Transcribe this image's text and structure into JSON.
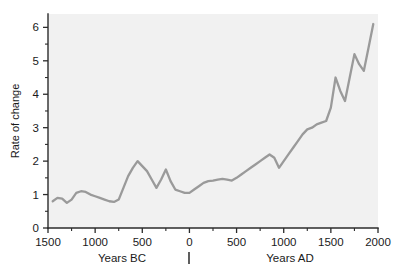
{
  "chart_data": {
    "type": "line",
    "title": "",
    "subtitle": "",
    "xlabel": "",
    "ylabel": "Rate of change",
    "era_labels": {
      "left": "Years BC",
      "right": "Years AD"
    },
    "xlim": [
      -1500,
      2000
    ],
    "ylim": [
      0,
      6.4
    ],
    "grid": false,
    "legend": null,
    "x_tick_labels": [
      "1500",
      "1000",
      "500",
      "0",
      "500",
      "1000",
      "1500",
      "2000"
    ],
    "x_tick_values": [
      -1500,
      -1000,
      -500,
      0,
      500,
      1000,
      1500,
      2000
    ],
    "x_minor_step": 250,
    "y_tick_labels": [
      "0",
      "1",
      "2",
      "3",
      "4",
      "5",
      "6"
    ],
    "y_tick_values": [
      0,
      1,
      2,
      3,
      4,
      5,
      6
    ],
    "y_minor_step": 0.5,
    "series": [
      {
        "name": "Rate of change",
        "color": "#9a9a9a",
        "x": [
          -1450,
          -1400,
          -1350,
          -1300,
          -1250,
          -1200,
          -1150,
          -1100,
          -1050,
          -1000,
          -950,
          -900,
          -850,
          -800,
          -750,
          -700,
          -650,
          -600,
          -550,
          -500,
          -450,
          -400,
          -350,
          -300,
          -250,
          -200,
          -150,
          -100,
          -50,
          0,
          50,
          100,
          150,
          200,
          250,
          300,
          350,
          400,
          450,
          500,
          550,
          600,
          650,
          700,
          750,
          800,
          850,
          900,
          950,
          1000,
          1050,
          1100,
          1150,
          1200,
          1250,
          1300,
          1350,
          1400,
          1450,
          1500,
          1550,
          1600,
          1650,
          1700,
          1750,
          1800,
          1850,
          1900,
          1950
        ],
        "y": [
          0.8,
          0.9,
          0.88,
          0.75,
          0.85,
          1.05,
          1.1,
          1.08,
          1.0,
          0.95,
          0.9,
          0.85,
          0.8,
          0.78,
          0.85,
          1.2,
          1.55,
          1.8,
          2.0,
          1.85,
          1.7,
          1.45,
          1.2,
          1.45,
          1.75,
          1.4,
          1.15,
          1.1,
          1.05,
          1.05,
          1.15,
          1.25,
          1.35,
          1.4,
          1.42,
          1.45,
          1.47,
          1.45,
          1.42,
          1.5,
          1.6,
          1.7,
          1.8,
          1.9,
          2.0,
          2.1,
          2.2,
          2.1,
          1.8,
          2.0,
          2.2,
          2.4,
          2.6,
          2.8,
          2.95,
          3.0,
          3.1,
          3.15,
          3.2,
          3.6,
          4.5,
          4.1,
          3.8,
          4.5,
          5.2,
          4.9,
          4.7,
          5.4,
          6.1
        ]
      }
    ]
  }
}
